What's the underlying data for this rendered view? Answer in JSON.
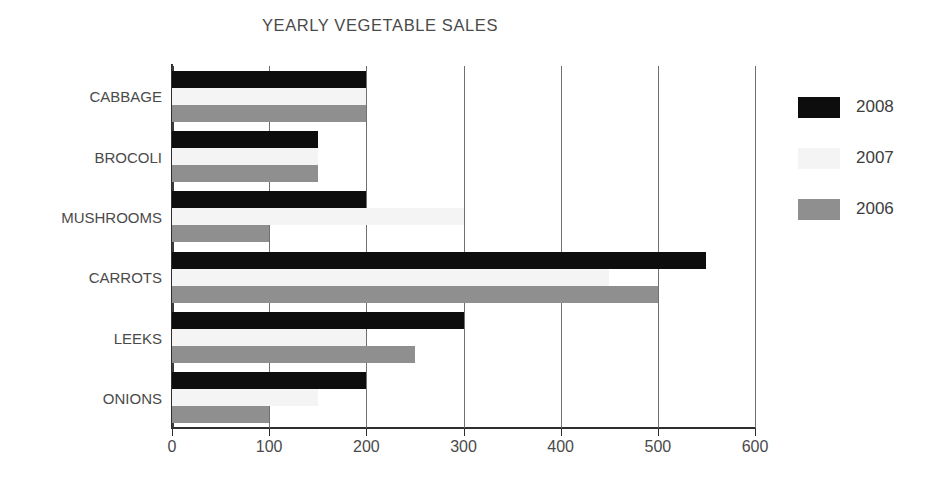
{
  "chart_data": {
    "type": "bar",
    "orientation": "horizontal",
    "title": "YEARLY VEGETABLE SALES",
    "xlabel": "",
    "ylabel": "",
    "categories": [
      "CABBAGE",
      "BROCOLI",
      "MUSHROOMS",
      "CARROTS",
      "LEEKS",
      "ONIONS"
    ],
    "series": [
      {
        "name": "2008",
        "color": "#0d0d0d",
        "values": [
          200,
          150,
          200,
          550,
          300,
          200
        ]
      },
      {
        "name": "2007",
        "color": "#f4f4f4",
        "values": [
          200,
          150,
          300,
          450,
          200,
          150
        ]
      },
      {
        "name": "2006",
        "color": "#8f8f8f",
        "values": [
          200,
          150,
          100,
          500,
          250,
          100
        ]
      }
    ],
    "xlim": [
      0,
      600
    ],
    "xticks": [
      0,
      100,
      200,
      300,
      400,
      500,
      600
    ],
    "xtick_labels": [
      "0",
      "100",
      "200",
      "300",
      "400",
      "500",
      "600"
    ],
    "grid": "vertical",
    "legend_position": "right",
    "legend_entries": [
      "2008",
      "2007",
      "2006"
    ]
  },
  "colors": {
    "background": "#ffffff",
    "text": "#4a4a4a",
    "axis": "#2e2e2e",
    "gridline": "#6f6f6f"
  }
}
